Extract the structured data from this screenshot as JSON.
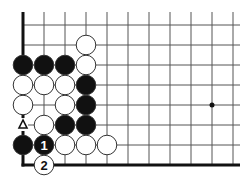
{
  "diagram": {
    "type": "go-board-fragment",
    "grid": {
      "columns": 11,
      "rows": 8,
      "origin_x": 23,
      "origin_y": 25,
      "spacing_x": 21,
      "spacing_y": 20,
      "top_open_y": 12,
      "right_open_x": 240,
      "left_edge": true,
      "bottom_edge": true
    },
    "star_points": [
      {
        "col": 9,
        "row": 4
      }
    ],
    "stones": [
      {
        "col": 3,
        "row": 1,
        "color": "white",
        "label": ""
      },
      {
        "col": 0,
        "row": 2,
        "color": "black",
        "label": ""
      },
      {
        "col": 1,
        "row": 2,
        "color": "black",
        "label": ""
      },
      {
        "col": 2,
        "row": 2,
        "color": "black",
        "label": ""
      },
      {
        "col": 3,
        "row": 2,
        "color": "white",
        "label": ""
      },
      {
        "col": 0,
        "row": 3,
        "color": "white",
        "label": ""
      },
      {
        "col": 1,
        "row": 3,
        "color": "white",
        "label": ""
      },
      {
        "col": 2,
        "row": 3,
        "color": "white",
        "label": ""
      },
      {
        "col": 3,
        "row": 3,
        "color": "black",
        "label": ""
      },
      {
        "col": 0,
        "row": 4,
        "color": "white",
        "label": ""
      },
      {
        "col": 2,
        "row": 4,
        "color": "white",
        "label": ""
      },
      {
        "col": 3,
        "row": 4,
        "color": "black",
        "label": ""
      },
      {
        "col": 1,
        "row": 5,
        "color": "white",
        "label": ""
      },
      {
        "col": 2,
        "row": 5,
        "color": "black",
        "label": ""
      },
      {
        "col": 3,
        "row": 5,
        "color": "black",
        "label": ""
      },
      {
        "col": 0,
        "row": 6,
        "color": "black",
        "label": ""
      },
      {
        "col": 1,
        "row": 6,
        "color": "black",
        "label": "1"
      },
      {
        "col": 2,
        "row": 6,
        "color": "white",
        "label": ""
      },
      {
        "col": 3,
        "row": 6,
        "color": "white",
        "label": ""
      },
      {
        "col": 4,
        "row": 6,
        "color": "white",
        "label": ""
      },
      {
        "col": 1,
        "row": 7,
        "color": "white",
        "label": "2"
      }
    ],
    "markers": [
      {
        "col": 0,
        "row": 5,
        "type": "triangle",
        "symbol": "△"
      }
    ],
    "colors": {
      "line": "#555555",
      "edge": "#111111",
      "black_stone": "#111111",
      "white_stone": "#ffffff",
      "stone_outline": "#333333"
    }
  }
}
